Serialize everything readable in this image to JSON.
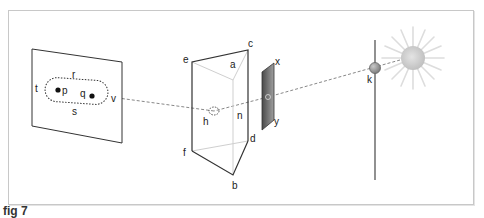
{
  "figure": {
    "caption": "fig 7"
  },
  "labels": {
    "screen": {
      "r": "r",
      "s": "s",
      "t": "t",
      "v": "v",
      "p": "p",
      "q": "q"
    },
    "prism": {
      "a": "a",
      "b": "b",
      "c": "c",
      "d": "d",
      "e": "e",
      "f": "f",
      "h": "h",
      "n": "n"
    },
    "filter": {
      "x": "x",
      "y": "y"
    },
    "source": {
      "k": "k"
    }
  },
  "colors": {
    "line": "#333333",
    "dashed_ray": "#888888",
    "prism_inner": "#c8c8c8",
    "filter_dark": "#555555",
    "filter_light": "#9a9a9a",
    "ball": "#9a9a9a",
    "sun": "#cfcfcf",
    "frame_border": "#c8c8c8"
  },
  "elements": [
    {
      "id": "screen",
      "description": "tilted rectangular screen with dotted rounded outline and two dots p and q"
    },
    {
      "id": "prism",
      "description": "triangular prism with vertices a-f, dashed circle h on ray"
    },
    {
      "id": "filter",
      "description": "small dark gradient plate x-y with ring on ray"
    },
    {
      "id": "pole",
      "description": "vertical rod with grey ball k"
    },
    {
      "id": "sun",
      "description": "light source with rays"
    },
    {
      "id": "ray",
      "description": "dashed line from sun through k, filter, prism h to screen v"
    }
  ]
}
